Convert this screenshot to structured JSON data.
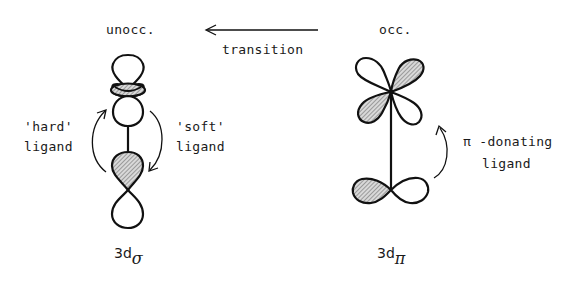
{
  "labels": {
    "unoccupied": "unocc.",
    "occupied": "occ.",
    "transition": "transition",
    "hard_ligand_line1": "'hard'",
    "hard_ligand_line2": "ligand",
    "soft_ligand_line1": "'soft'",
    "soft_ligand_line2": "ligand",
    "pi_donating_line1": "π -donating",
    "pi_donating_line2": "ligand"
  },
  "orbitals": {
    "left": {
      "prefix": "3d",
      "subscript": "σ"
    },
    "right": {
      "prefix": "3d",
      "subscript": "π"
    }
  },
  "colors": {
    "stroke": "#111111",
    "hatch": "#8a8a8a",
    "background": "#ffffff"
  }
}
